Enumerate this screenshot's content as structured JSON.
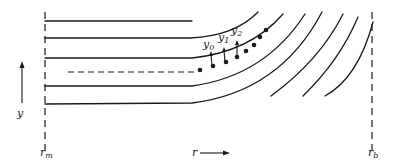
{
  "figure": {
    "stroke_color": "#1a1a1a",
    "background": "#ffffff"
  },
  "labels": {
    "y_axis": "y",
    "r_axis": "r",
    "r_m": {
      "base": "r",
      "sub": "m"
    },
    "r_b": {
      "base": "r",
      "sub": "b"
    },
    "y0": {
      "base": "y",
      "sub": "0"
    },
    "y1": {
      "base": "y",
      "sub": "1"
    },
    "y2": {
      "base": "y",
      "sub": "2"
    }
  },
  "boundaries": {
    "left_dashed": "r_m",
    "right_dashed": "r_b"
  },
  "streamlines_count": 5,
  "outer_arcs_count": 4,
  "points_count": 9
}
